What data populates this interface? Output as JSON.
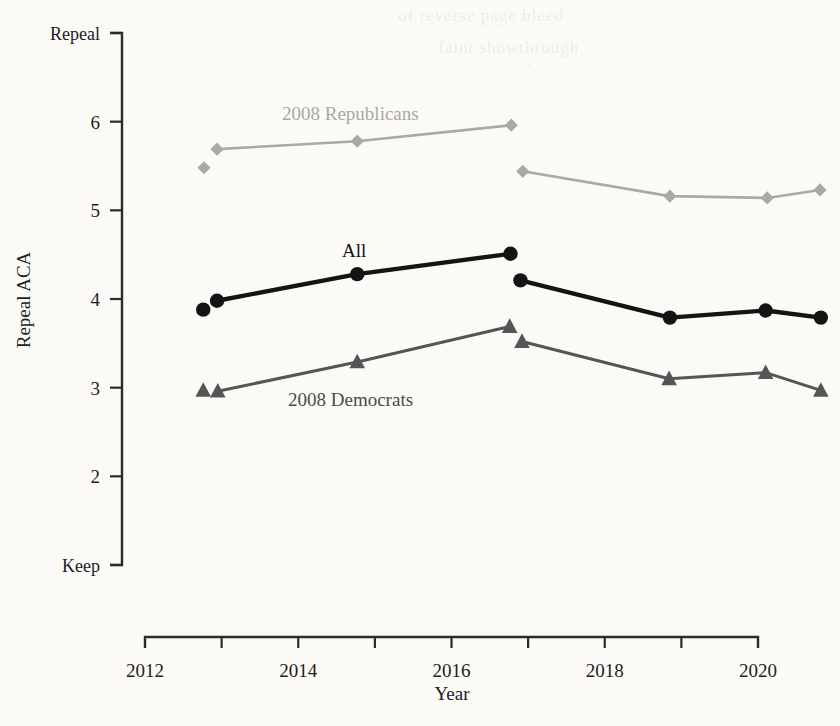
{
  "figure": {
    "background_color": "#fbfaf7",
    "width": 840,
    "height": 726
  },
  "axes": {
    "y_title": "Repeal ACA",
    "x_title": "Year",
    "y_ticks": [
      "Keep",
      "2",
      "3",
      "4",
      "5",
      "6",
      "Repeal"
    ],
    "y_tick_values": [
      1,
      2,
      3,
      4,
      5,
      6,
      7
    ],
    "y_range": [
      1,
      7
    ],
    "x_ticks": [
      "2012",
      "2014",
      "2016",
      "2018",
      "2020"
    ],
    "x_tick_values": [
      2012,
      2014,
      2016,
      2018,
      2020
    ],
    "x_minor_tick_values": [
      2013,
      2015,
      2017,
      2019
    ],
    "x_range": [
      2012,
      2020.1
    ],
    "grid": "off"
  },
  "labels": {
    "republicans": "2008 Republicans",
    "all": "All",
    "democrats": "2008 Democrats"
  },
  "colors": {
    "republicans": "#a9a9a9",
    "all": "#141414",
    "democrats": "#555555",
    "axis": "#2b2b2b"
  },
  "ghost_text": {
    "line1": "of reverse page bleed",
    "line2": "faint showthrough"
  },
  "chart_data": {
    "type": "line",
    "title": "",
    "xlabel": "Year",
    "ylabel": "Repeal ACA",
    "xlim": [
      2012,
      2020.1
    ],
    "ylim": [
      1,
      7
    ],
    "ytick_labels": [
      "Keep",
      "2",
      "3",
      "4",
      "5",
      "6",
      "Repeal"
    ],
    "ytick_values": [
      1,
      2,
      3,
      4,
      5,
      6,
      7
    ],
    "xtick_values": [
      2012,
      2014,
      2016,
      2018,
      2020
    ],
    "grid": false,
    "legend": "inline-annotations",
    "series": [
      {
        "name": "2008 Republicans",
        "marker": "diamond",
        "color": "#a9a9a9",
        "x": [
          2012.77,
          2012.94,
          2014.77,
          2016.78,
          2016.93,
          2018.85,
          2020.12,
          2020.81
        ],
        "y": [
          5.48,
          5.69,
          5.78,
          5.96,
          5.44,
          5.16,
          5.14,
          5.23
        ],
        "segments": [
          [
            1,
            2,
            3
          ],
          [
            4,
            5,
            6,
            7
          ]
        ]
      },
      {
        "name": "All",
        "marker": "circle",
        "color": "#141414",
        "x": [
          2012.76,
          2012.94,
          2014.77,
          2016.77,
          2016.9,
          2018.85,
          2020.1,
          2020.82
        ],
        "y": [
          3.88,
          3.98,
          4.28,
          4.51,
          4.21,
          3.79,
          3.87,
          3.79
        ],
        "segments": [
          [
            1,
            2,
            3
          ],
          [
            4,
            5,
            6,
            7
          ]
        ]
      },
      {
        "name": "2008 Democrats",
        "marker": "triangle",
        "color": "#555555",
        "x": [
          2012.76,
          2012.95,
          2014.77,
          2016.76,
          2016.92,
          2018.84,
          2020.1,
          2020.82
        ],
        "y": [
          2.97,
          2.96,
          3.29,
          3.69,
          3.52,
          3.1,
          3.17,
          2.97
        ],
        "segments": [
          [
            1,
            2,
            3
          ],
          [
            4,
            5,
            6,
            7
          ]
        ]
      }
    ],
    "annotations": [
      {
        "text": "2008 Republicans",
        "x": 2013.8,
        "y": 6.35
      },
      {
        "text": "All",
        "x": 2014.6,
        "y": 4.82
      },
      {
        "text": "2008 Democrats",
        "x": 2013.9,
        "y": 3.02
      }
    ]
  }
}
